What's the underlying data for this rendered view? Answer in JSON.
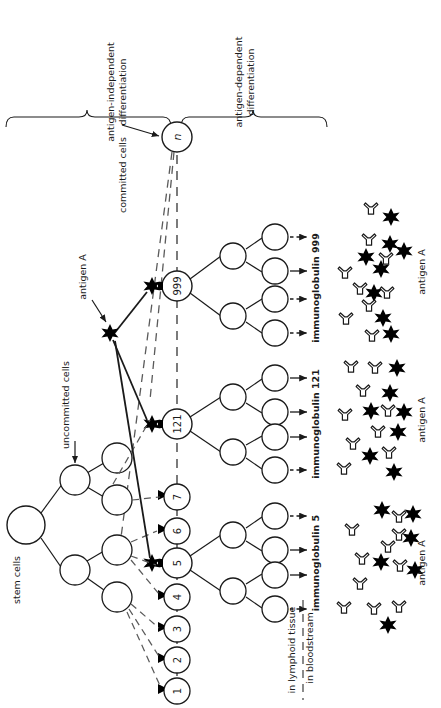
{
  "figure": {
    "domain": "immunology-diagram",
    "orientation": "text-rotated-90-ccw"
  },
  "brackets": [
    {
      "id": "antigen-independent",
      "label": "antigen-independent\ndifferentiation",
      "line1": "antigen-independent",
      "line2": "differentiation"
    },
    {
      "id": "antigen-dependent",
      "label": "antigen-dependent\ndifferentiation",
      "line1": "antigen-dependent",
      "line2": "differentiation"
    }
  ],
  "labels": {
    "stem_cells": "stem cells",
    "uncommitted_cells": "uncommitted cells",
    "committed_cells": "committed cells",
    "antigen_a_pointer": "antigen A",
    "in_lymphoid_tissue": "in lymphoid tissue",
    "in_bloodstream": "in bloodstream"
  },
  "committed_cells": {
    "ids": [
      "1",
      "2",
      "3",
      "4",
      "5",
      "6",
      "7",
      "121",
      "999",
      "n"
    ],
    "activated": [
      "5",
      "121",
      "999"
    ],
    "note": "each committed cell carries one antigen receptor specificity"
  },
  "clones": [
    {
      "id": "clone-999",
      "parent_label": "999",
      "output_label": "immunoglobulin 999",
      "antigen_label": "antigen A",
      "plasma_cells": 4,
      "arrow_styles": [
        "dashed",
        "solid",
        "dashed",
        "dashed"
      ]
    },
    {
      "id": "clone-121",
      "parent_label": "121",
      "output_label": "immunoglobulin 121",
      "antigen_label": "antigen A",
      "plasma_cells": 4,
      "arrow_styles": [
        "solid",
        "solid",
        "solid",
        "dashed"
      ]
    },
    {
      "id": "clone-5",
      "parent_label": "5",
      "output_label": "immunoglobulin 5",
      "antigen_label": "antigen A",
      "plasma_cells": 4,
      "arrow_styles": [
        "dashed",
        "solid",
        "solid",
        "dashed"
      ]
    }
  ],
  "legend_symbols": {
    "antigen": "black-star",
    "antibody": "white-y-shape",
    "cell": "open-circle",
    "receptor": "small-black-notch"
  },
  "colors": {
    "ink": "#1a1a1a",
    "fill": "#ffffff",
    "antigen": "#000000",
    "background": "#ffffff"
  }
}
